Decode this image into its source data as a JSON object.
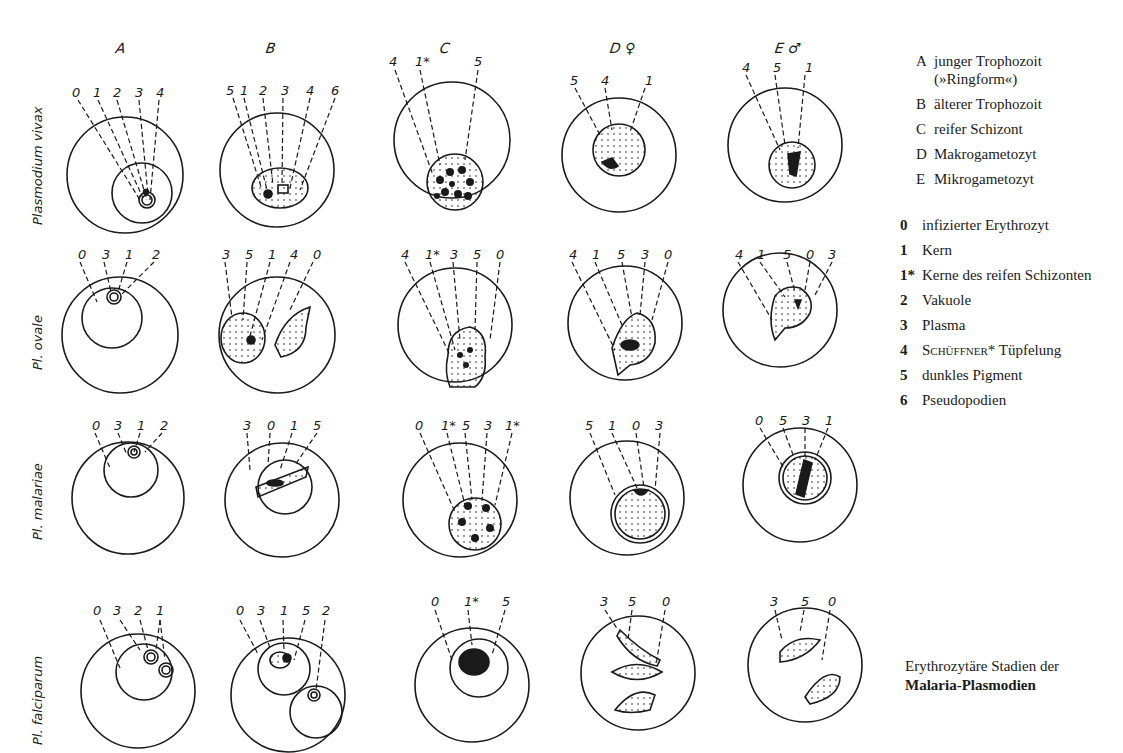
{
  "columns": [
    {
      "key": "A",
      "label": "A"
    },
    {
      "key": "B",
      "label": "B"
    },
    {
      "key": "C",
      "label": "C"
    },
    {
      "key": "D",
      "label": "D ♀"
    },
    {
      "key": "E",
      "label": "E ♂"
    }
  ],
  "rows": [
    {
      "label": "Plasmodium vivax",
      "callouts": [
        [
          "0",
          "1",
          "2",
          "3",
          "4"
        ],
        [
          "5",
          "1",
          "2",
          "3",
          "4",
          "6"
        ],
        [
          "4",
          "1*",
          "5"
        ],
        [
          "5",
          "4",
          "1"
        ],
        [
          "4",
          "5",
          "1"
        ]
      ]
    },
    {
      "label": "Pl. ovale",
      "callouts": [
        [
          "0",
          "3",
          "1",
          "2"
        ],
        [
          "3",
          "5",
          "1",
          "4",
          "0"
        ],
        [
          "4",
          "1*",
          "3",
          "5",
          "0"
        ],
        [
          "4",
          "1",
          "5",
          "3",
          "0"
        ],
        [
          "4",
          "1",
          "5",
          "0",
          "3"
        ]
      ]
    },
    {
      "label": "Pl. malariae",
      "callouts": [
        [
          "0",
          "3",
          "1",
          "2"
        ],
        [
          "3",
          "0",
          "1",
          "5"
        ],
        [
          "0",
          "1*",
          "5",
          "3",
          "1*"
        ],
        [
          "5",
          "1",
          "0",
          "3"
        ],
        [
          "0",
          "5",
          "3",
          "1"
        ]
      ]
    },
    {
      "label": "Pl. falciparum",
      "callouts": [
        [
          "0",
          "3",
          "2",
          "1"
        ],
        [
          "0",
          "3",
          "1",
          "5",
          "2"
        ],
        [
          "0",
          "1*",
          "5"
        ],
        [
          "3",
          "5",
          "0"
        ],
        [
          "3",
          "5",
          "0"
        ]
      ]
    }
  ],
  "stage_legend": [
    {
      "key": "A",
      "text": "junger Trophozoit (»Ringform«)"
    },
    {
      "key": "B",
      "text": "älterer Trophozoit"
    },
    {
      "key": "C",
      "text": "reifer Schizont"
    },
    {
      "key": "D",
      "text": "Makrogametozyt"
    },
    {
      "key": "E",
      "text": "Mikrogametozyt"
    }
  ],
  "structure_legend": [
    {
      "key": "0",
      "text": "infizierter Erythrozyt"
    },
    {
      "key": "1",
      "text": "Kern"
    },
    {
      "key": "1*",
      "text": "Kerne des reifen Schizonten"
    },
    {
      "key": "2",
      "text": "Vakuole"
    },
    {
      "key": "3",
      "text": "Plasma"
    },
    {
      "key": "4",
      "text_sc": "Schüffner",
      "text": "* Tüpfelung"
    },
    {
      "key": "5",
      "text": "dunkles Pigment"
    },
    {
      "key": "6",
      "text": "Pseudopodien"
    }
  ],
  "caption": {
    "line1": "Erythrozytäre Stadien der",
    "line2": "Malaria-Plasmodien"
  }
}
